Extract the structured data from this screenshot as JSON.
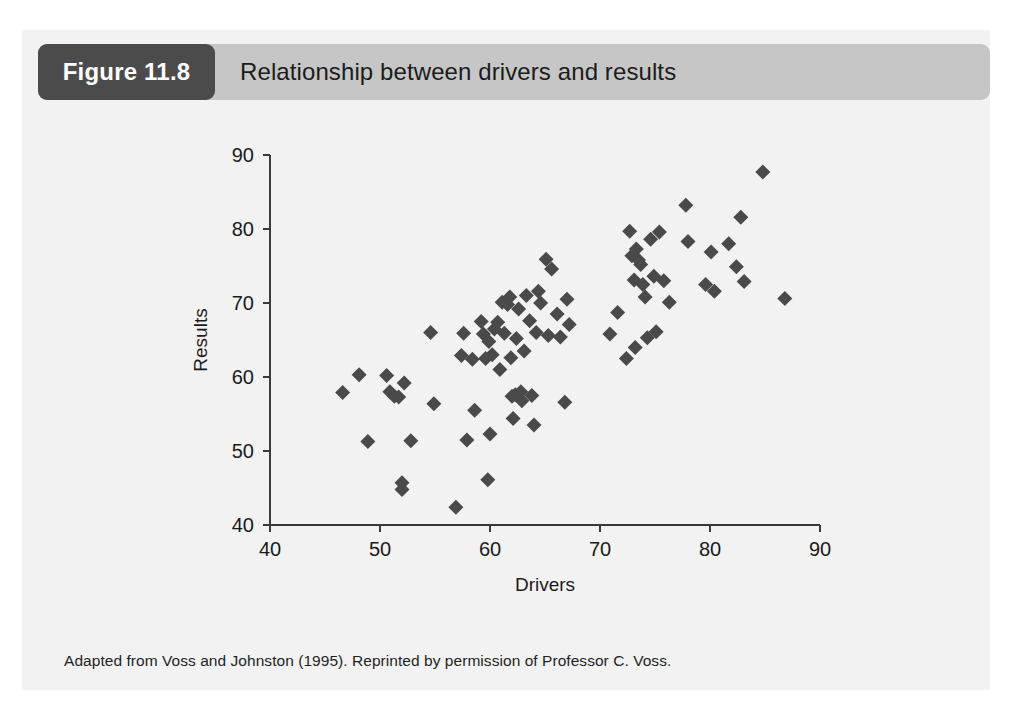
{
  "page": {
    "top_running_text": ""
  },
  "figure": {
    "number_label": "Figure 11.8",
    "title": "Relationship between drivers and results",
    "caption": "Adapted from Voss and Johnston (1995). Reprinted by permission of Professor C. Voss.",
    "colors": {
      "panel_background": "#f2f2f2",
      "header_background": "#c6c6c6",
      "badge_background": "#4b4b4b",
      "badge_text": "#ffffff",
      "marker": "#4a4a4a",
      "axis": "#3a3a3a",
      "text": "#1a1a1a"
    }
  },
  "chart_data": {
    "type": "scatter",
    "title": "Relationship between drivers and results",
    "xlabel": "Drivers",
    "ylabel": "Results",
    "xlim": [
      40,
      90
    ],
    "ylim": [
      40,
      90
    ],
    "xticks": [
      40,
      50,
      60,
      70,
      80,
      90
    ],
    "yticks": [
      40,
      50,
      60,
      70,
      80,
      90
    ],
    "grid": false,
    "legend": null,
    "marker_shape": "diamond",
    "marker_color": "#4a4a4a",
    "n_points": 86,
    "points": [
      [
        46.6,
        57.9
      ],
      [
        48.1,
        60.3
      ],
      [
        48.9,
        51.3
      ],
      [
        50.6,
        60.2
      ],
      [
        50.9,
        58.0
      ],
      [
        51.3,
        57.4
      ],
      [
        51.7,
        57.3
      ],
      [
        52.0,
        45.7
      ],
      [
        52.0,
        44.8
      ],
      [
        52.2,
        59.2
      ],
      [
        52.8,
        51.4
      ],
      [
        54.6,
        66.0
      ],
      [
        54.9,
        56.4
      ],
      [
        56.9,
        42.4
      ],
      [
        57.4,
        62.9
      ],
      [
        57.6,
        65.9
      ],
      [
        57.9,
        51.5
      ],
      [
        58.4,
        62.4
      ],
      [
        58.6,
        55.5
      ],
      [
        59.2,
        67.5
      ],
      [
        59.4,
        65.8
      ],
      [
        59.6,
        62.5
      ],
      [
        59.8,
        46.1
      ],
      [
        59.9,
        64.8
      ],
      [
        60.0,
        52.3
      ],
      [
        60.2,
        63.0
      ],
      [
        60.4,
        66.5
      ],
      [
        60.7,
        67.4
      ],
      [
        60.9,
        61.0
      ],
      [
        61.1,
        70.1
      ],
      [
        61.3,
        65.9
      ],
      [
        61.6,
        69.8
      ],
      [
        61.8,
        70.8
      ],
      [
        61.9,
        62.6
      ],
      [
        62.0,
        57.4
      ],
      [
        62.1,
        54.4
      ],
      [
        62.3,
        57.6
      ],
      [
        62.4,
        65.2
      ],
      [
        62.6,
        69.2
      ],
      [
        62.8,
        58.0
      ],
      [
        62.9,
        56.8
      ],
      [
        63.1,
        63.5
      ],
      [
        63.3,
        71.0
      ],
      [
        63.6,
        67.6
      ],
      [
        63.8,
        57.5
      ],
      [
        64.0,
        53.5
      ],
      [
        64.2,
        66.0
      ],
      [
        64.4,
        71.6
      ],
      [
        64.6,
        70.0
      ],
      [
        65.1,
        75.9
      ],
      [
        65.3,
        65.6
      ],
      [
        65.6,
        74.6
      ],
      [
        66.1,
        68.5
      ],
      [
        66.4,
        65.4
      ],
      [
        66.8,
        56.6
      ],
      [
        67.0,
        70.5
      ],
      [
        67.2,
        67.1
      ],
      [
        70.9,
        65.8
      ],
      [
        71.6,
        68.7
      ],
      [
        72.4,
        62.5
      ],
      [
        72.7,
        79.7
      ],
      [
        72.9,
        76.4
      ],
      [
        73.1,
        73.1
      ],
      [
        73.2,
        64.0
      ],
      [
        73.3,
        77.3
      ],
      [
        73.5,
        75.8
      ],
      [
        73.7,
        75.2
      ],
      [
        73.9,
        72.5
      ],
      [
        74.1,
        70.8
      ],
      [
        74.3,
        65.3
      ],
      [
        74.6,
        78.6
      ],
      [
        74.9,
        73.6
      ],
      [
        75.1,
        66.1
      ],
      [
        75.4,
        79.6
      ],
      [
        75.8,
        73.0
      ],
      [
        76.3,
        70.1
      ],
      [
        77.8,
        83.2
      ],
      [
        78.0,
        78.3
      ],
      [
        79.6,
        72.5
      ],
      [
        80.1,
        76.9
      ],
      [
        80.4,
        71.6
      ],
      [
        81.7,
        78.0
      ],
      [
        82.4,
        74.9
      ],
      [
        82.8,
        81.6
      ],
      [
        83.1,
        72.9
      ],
      [
        84.8,
        87.7
      ],
      [
        86.8,
        70.6
      ]
    ]
  }
}
